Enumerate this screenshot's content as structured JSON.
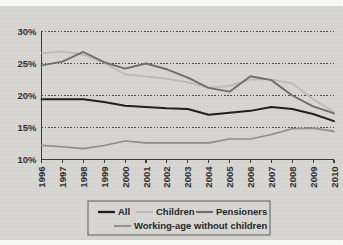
{
  "chart_data": {
    "type": "line",
    "title": "",
    "xlabel": "",
    "ylabel": "",
    "grid": true,
    "legend_position": "bottom",
    "x": [
      1996,
      1997,
      1998,
      1999,
      2000,
      2001,
      2002,
      2003,
      2004,
      2005,
      2006,
      2007,
      2008,
      2009,
      2010
    ],
    "xtick_labels": [
      "1996",
      "1997",
      "1998",
      "1999",
      "2000",
      "2001",
      "2002",
      "2003",
      "2004",
      "2005",
      "2006",
      "2007",
      "2008",
      "2009",
      "2010"
    ],
    "ytick_labels": [
      "30%",
      "25%",
      "20%",
      "15%",
      "10%"
    ],
    "ytick_values": [
      30,
      25,
      20,
      15,
      10
    ],
    "ylim": [
      10,
      30
    ],
    "series": [
      {
        "name": "All",
        "color": "#1b1b1b",
        "width": 2.0,
        "values": [
          19.4,
          19.4,
          19.4,
          19.0,
          18.4,
          18.2,
          18.0,
          17.9,
          17.0,
          17.3,
          17.6,
          18.2,
          17.9,
          17.1,
          16.0
        ]
      },
      {
        "name": "Children",
        "color": "#b9b9b9",
        "width": 1.7,
        "values": [
          26.6,
          26.9,
          26.4,
          25.1,
          23.3,
          23.0,
          22.6,
          22.1,
          21.2,
          21.5,
          22.5,
          22.5,
          21.9,
          19.4,
          17.4
        ]
      },
      {
        "name": "Pensioners",
        "color": "#6d6d6d",
        "width": 1.9,
        "values": [
          24.7,
          25.3,
          26.8,
          25.2,
          24.2,
          25.0,
          24.1,
          22.8,
          21.2,
          20.6,
          23.0,
          22.4,
          20.0,
          18.3,
          17.2
        ]
      },
      {
        "name": "Working-age without children",
        "color": "#8e8e8e",
        "width": 1.6,
        "values": [
          12.2,
          12.0,
          11.7,
          12.2,
          12.9,
          12.6,
          12.6,
          12.6,
          12.6,
          13.2,
          13.2,
          13.9,
          14.8,
          14.9,
          14.4
        ]
      }
    ]
  },
  "legend": {
    "items": [
      {
        "label": "All"
      },
      {
        "label": "Children"
      },
      {
        "label": "Pensioners"
      },
      {
        "label": "Working-age without children"
      }
    ]
  },
  "colors": {
    "background": "#d8d7d4",
    "axis": "#3a3a3a",
    "gridline": "#3f3f3f",
    "legend_border": "#6f6f6f"
  }
}
